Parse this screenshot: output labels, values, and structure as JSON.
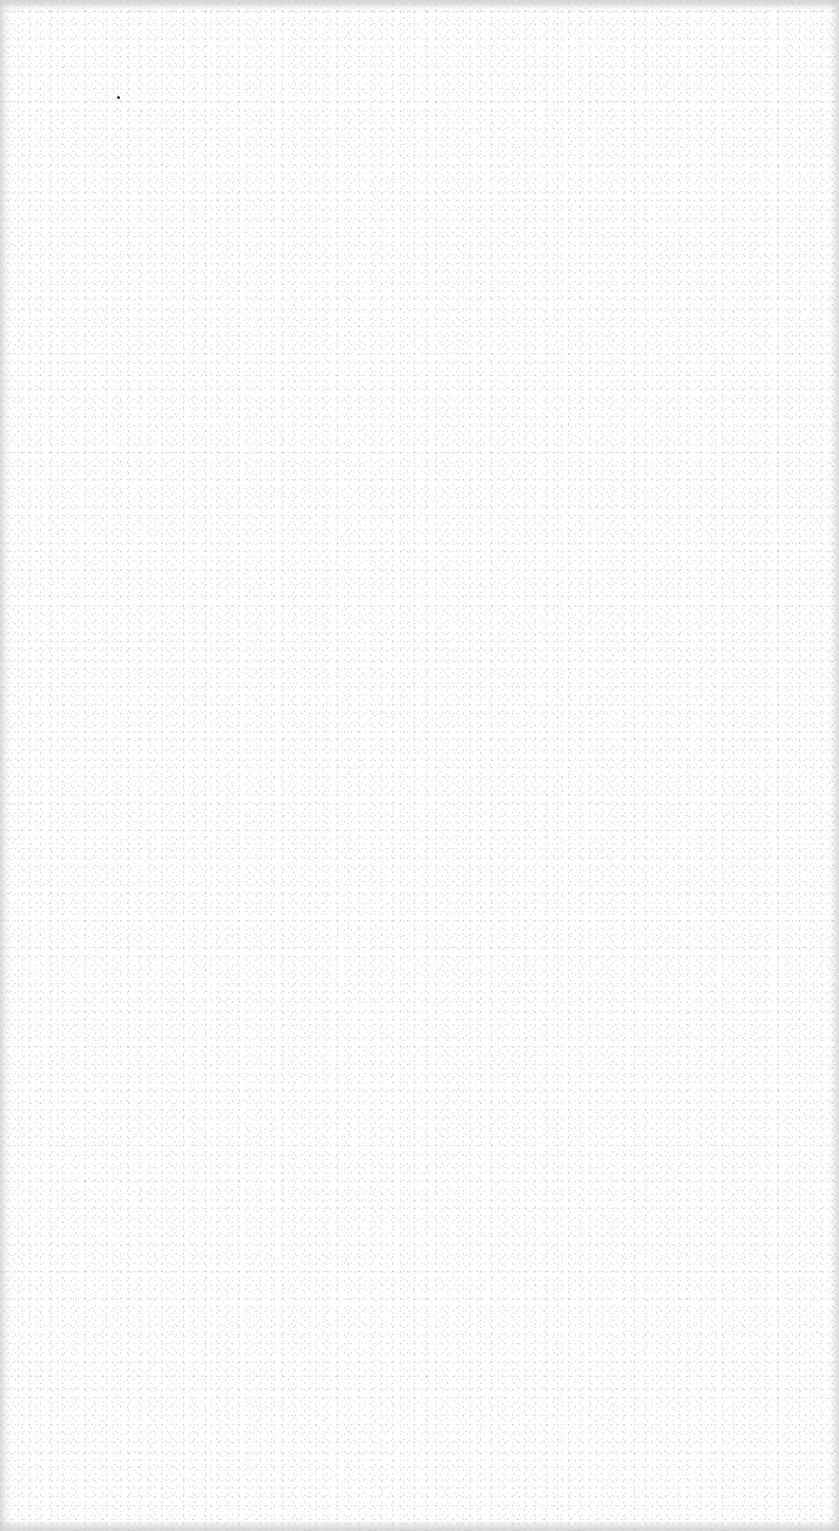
{
  "document": {
    "type": "blank scanned page",
    "background_color": "#ffffff",
    "edge_vignette_color": "#c8c8c8",
    "text_content": []
  },
  "artifacts": [
    {
      "kind": "dust-speck",
      "x": 118,
      "y": 97,
      "color": "#333333"
    }
  ]
}
